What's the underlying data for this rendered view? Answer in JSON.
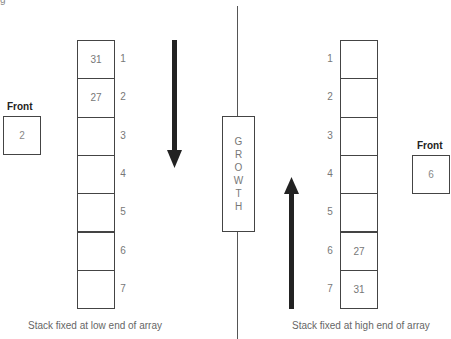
{
  "partial_caption": "g",
  "center_label": "GROWTH",
  "left": {
    "front_label": "Front",
    "front_value": "2",
    "caption": "Stack fixed at low end of array",
    "arrow_direction": "down",
    "cells": [
      {
        "index": "1",
        "value": "31"
      },
      {
        "index": "2",
        "value": "27"
      },
      {
        "index": "3",
        "value": ""
      },
      {
        "index": "4",
        "value": ""
      },
      {
        "index": "5",
        "value": ""
      },
      {
        "index": "6",
        "value": ""
      },
      {
        "index": "7",
        "value": ""
      }
    ]
  },
  "right": {
    "front_label": "Front",
    "front_value": "6",
    "caption": "Stack fixed at high end of array",
    "arrow_direction": "up",
    "cells": [
      {
        "index": "1",
        "value": ""
      },
      {
        "index": "2",
        "value": ""
      },
      {
        "index": "3",
        "value": ""
      },
      {
        "index": "4",
        "value": ""
      },
      {
        "index": "5",
        "value": ""
      },
      {
        "index": "6",
        "value": "27"
      },
      {
        "index": "7",
        "value": "31"
      }
    ]
  }
}
